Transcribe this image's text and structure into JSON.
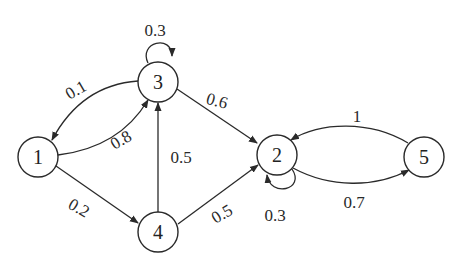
{
  "diagram": {
    "type": "markov-chain-state-graph",
    "nodes": [
      {
        "id": "1",
        "label": "1",
        "x": 38,
        "y": 157
      },
      {
        "id": "2",
        "label": "2",
        "x": 277,
        "y": 155
      },
      {
        "id": "3",
        "label": "3",
        "x": 158,
        "y": 82
      },
      {
        "id": "4",
        "label": "4",
        "x": 158,
        "y": 232
      },
      {
        "id": "5",
        "label": "5",
        "x": 424,
        "y": 157
      }
    ],
    "edges": [
      {
        "from": "3",
        "to": "3",
        "label": "0.3"
      },
      {
        "from": "3",
        "to": "1",
        "label": "0.1"
      },
      {
        "from": "1",
        "to": "3",
        "label": "0.8"
      },
      {
        "from": "3",
        "to": "2",
        "label": "0.6"
      },
      {
        "from": "1",
        "to": "4",
        "label": "0.2"
      },
      {
        "from": "4",
        "to": "3",
        "label": "0.5"
      },
      {
        "from": "4",
        "to": "2",
        "label": "0.5"
      },
      {
        "from": "2",
        "to": "2",
        "label": "0.3"
      },
      {
        "from": "5",
        "to": "2",
        "label": "1"
      },
      {
        "from": "2",
        "to": "5",
        "label": "0.7"
      }
    ]
  },
  "labels": {
    "n1": "1",
    "n2": "2",
    "n3": "3",
    "n4": "4",
    "n5": "5",
    "e33": "0.3",
    "e31": "0.1",
    "e13": "0.8",
    "e32": "0.6",
    "e14": "0.2",
    "e43": "0.5",
    "e42": "0.5",
    "e22": "0.3",
    "e52": "1",
    "e25": "0.7"
  }
}
